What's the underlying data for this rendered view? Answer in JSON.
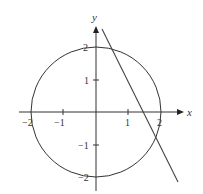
{
  "diagram": {
    "axes": {
      "x_label": "x",
      "y_label": "y",
      "x_ticks": [
        {
          "value": -2,
          "label": "−2"
        },
        {
          "value": -1,
          "label": "−1"
        },
        {
          "value": 1,
          "label": "1"
        },
        {
          "value": 2,
          "label": "2"
        }
      ],
      "y_ticks": [
        {
          "value": 2,
          "label": "2"
        },
        {
          "value": 1,
          "label": "1"
        },
        {
          "value": -1,
          "label": "−1"
        },
        {
          "value": -2,
          "label": "−2"
        }
      ]
    },
    "circle": {
      "center": [
        0,
        0
      ],
      "radius": 2
    },
    "line": {
      "from": [
        0.2,
        2.6
      ],
      "to": [
        2.6,
        -2.2
      ]
    },
    "colors": {
      "stroke": "#333333",
      "background": "#ffffff"
    }
  }
}
